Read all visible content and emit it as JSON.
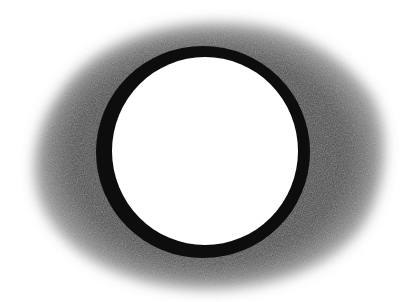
{
  "image": {
    "subject": "charcoal drawing of a black ring with shaded halo",
    "background_color": "#ffffff",
    "halo_color": "#4a4a4a",
    "ring_color": "#0d0d0d",
    "center_color": "#ffffff"
  }
}
